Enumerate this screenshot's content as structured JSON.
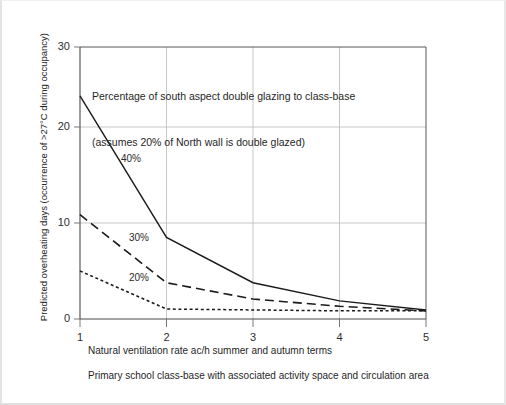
{
  "chart_data": {
    "type": "line",
    "title": "",
    "xlabel": "Natural ventilation rate ac/h summer and autumn terms",
    "ylabel": "Predicted overheating days (occurrence of >27°C during occupancy)",
    "caption": "Primary school class-base with associated activity space and circulation area",
    "annotation_line1": "Percentage of south aspect double glazing to class-base",
    "annotation_line2": "(assumes 20% of North wall is double glazed)",
    "x": [
      1,
      2,
      3,
      4,
      5
    ],
    "xlim": [
      1,
      5
    ],
    "ylim": [
      0,
      30
    ],
    "xticks": [
      "1",
      "2",
      "3",
      "4",
      "5"
    ],
    "yticks": [
      "0",
      "10",
      "20",
      "30"
    ],
    "ytick_values": [
      0,
      10,
      20,
      30
    ],
    "grid": true,
    "legend": "inline-series-labels",
    "series": [
      {
        "name": "40%",
        "label": "40%",
        "style": "solid",
        "color": "#1a1a1a",
        "values": [
          24.6,
          9.0,
          4.0,
          2.0,
          1.0
        ]
      },
      {
        "name": "30%",
        "label": "30%",
        "style": "dashed",
        "color": "#1a1a1a",
        "values": [
          11.5,
          4.0,
          2.2,
          1.4,
          0.9
        ]
      },
      {
        "name": "20%",
        "label": "20%",
        "style": "dotted",
        "color": "#1a1a1a",
        "values": [
          5.3,
          1.1,
          1.0,
          0.9,
          0.9
        ]
      }
    ]
  },
  "axis": {
    "y_tick_0": "0",
    "y_tick_10": "10",
    "y_tick_20": "20",
    "y_tick_30": "30",
    "x_tick_1": "1",
    "x_tick_2": "2",
    "x_tick_3": "3",
    "x_tick_4": "4",
    "x_tick_5": "5"
  },
  "labels": {
    "series_40": "40%",
    "series_30": "30%",
    "series_20": "20%"
  }
}
